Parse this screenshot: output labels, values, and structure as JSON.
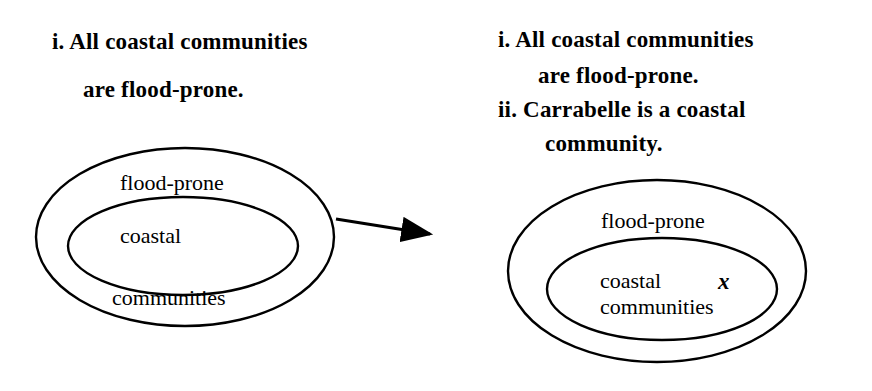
{
  "left_panel": {
    "premise_i_line1": "i. All coastal communities",
    "premise_i_line2": "are flood-prone.",
    "outer_set_label": "flood-prone",
    "inner_set_label_line1": "coastal",
    "inner_set_label_line2": "communities"
  },
  "right_panel": {
    "premise_i_line1": "i. All coastal communities",
    "premise_i_line2": "are flood-prone.",
    "premise_ii_line1": "ii. Carrabelle is a coastal",
    "premise_ii_line2": "community.",
    "outer_set_label": "flood-prone",
    "inner_set_label_line1": "coastal",
    "inner_set_label_line2": "communities",
    "element_marker": "x"
  },
  "arrow": {
    "from": "left_panel",
    "to": "right_panel"
  },
  "colors": {
    "stroke": "#000000",
    "background": "#ffffff"
  }
}
